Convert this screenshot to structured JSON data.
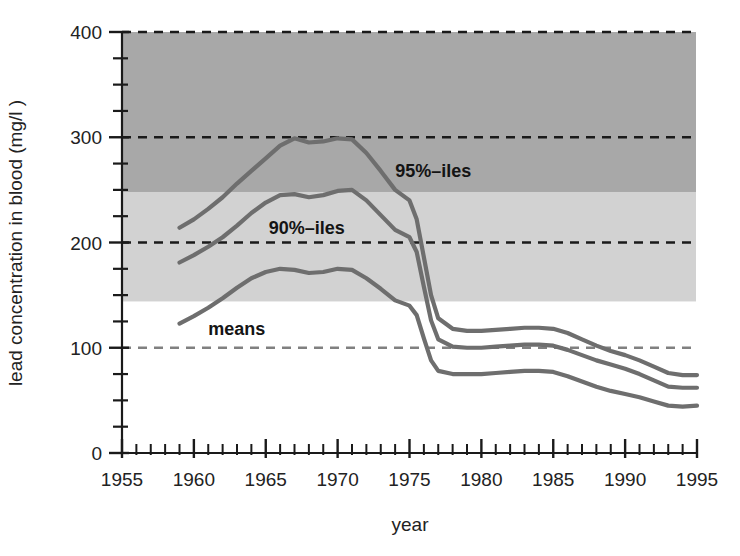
{
  "chart_data": {
    "type": "line",
    "title": "",
    "xlabel": "year",
    "ylabel": "lead concentration in blood (mg/l )",
    "xlim": [
      1955,
      1995
    ],
    "ylim": [
      0,
      400
    ],
    "grid": "dashed horizontal gridlines at 100, 200, 300, 400",
    "legend_position": "inline annotations on curves",
    "x_ticks_major": [
      1955,
      1960,
      1965,
      1970,
      1975,
      1980,
      1985,
      1990,
      1995
    ],
    "x_tick_labels": [
      "1955",
      "1960",
      "1965",
      "1970",
      "1975",
      "1980",
      "1985",
      "1990",
      "1995"
    ],
    "x_tick_minor_step": 1,
    "y_ticks_major": [
      0,
      100,
      200,
      300,
      400
    ],
    "y_tick_labels": [
      "0",
      "100",
      "200",
      "300",
      "400"
    ],
    "y_tick_minor_step": 25,
    "bands": [
      {
        "name": "dark-band",
        "from": 248,
        "to": 400,
        "color": "#a8a8a8"
      },
      {
        "name": "light-band",
        "from": 144,
        "to": 248,
        "color": "#d2d2d2"
      }
    ],
    "gridlines": [
      {
        "value": 400,
        "color": "#1a1a1a"
      },
      {
        "value": 300,
        "color": "#1a1a1a"
      },
      {
        "value": 200,
        "color": "#1a1a1a"
      },
      {
        "value": 100,
        "color": "#808080"
      }
    ],
    "line_color": "#6e6e6e",
    "series": [
      {
        "name": "95%-iles",
        "label": "95%–iles",
        "label_x": 1974.0,
        "label_y": 268,
        "x": [
          1959,
          1960,
          1961,
          1962,
          1963,
          1964,
          1965,
          1966,
          1967,
          1968,
          1969,
          1970,
          1971,
          1972,
          1973,
          1974,
          1975,
          1975.5,
          1976,
          1976.5,
          1977,
          1978,
          1979,
          1980,
          1981,
          1982,
          1983,
          1984,
          1985,
          1986,
          1987,
          1988,
          1989,
          1990,
          1991,
          1992,
          1993,
          1994,
          1995
        ],
        "y": [
          214,
          222,
          232,
          243,
          256,
          268,
          280,
          292,
          299,
          295,
          296,
          299,
          298,
          285,
          268,
          250,
          240,
          222,
          186,
          150,
          128,
          118,
          116,
          116,
          117,
          118,
          119,
          119,
          118,
          114,
          108,
          102,
          97,
          93,
          88,
          82,
          76,
          74,
          74
        ]
      },
      {
        "name": "90%-iles",
        "label": "90%–iles",
        "label_x": 1965.2,
        "label_y": 214,
        "x": [
          1959,
          1960,
          1961,
          1962,
          1963,
          1964,
          1965,
          1966,
          1967,
          1968,
          1969,
          1970,
          1971,
          1972,
          1973,
          1974,
          1975,
          1975.5,
          1976,
          1976.5,
          1977,
          1978,
          1979,
          1980,
          1981,
          1982,
          1983,
          1984,
          1985,
          1986,
          1987,
          1988,
          1989,
          1990,
          1991,
          1992,
          1993,
          1994,
          1995
        ],
        "y": [
          181,
          188,
          196,
          205,
          216,
          228,
          238,
          245,
          246,
          243,
          245,
          249,
          250,
          240,
          226,
          212,
          205,
          191,
          158,
          126,
          108,
          101,
          100,
          100,
          101,
          102,
          103,
          103,
          102,
          98,
          93,
          88,
          84,
          80,
          75,
          69,
          63,
          62,
          62
        ]
      },
      {
        "name": "means",
        "label": "means",
        "label_x": 1961.0,
        "label_y": 118,
        "x": [
          1959,
          1960,
          1961,
          1962,
          1963,
          1964,
          1965,
          1966,
          1967,
          1968,
          1969,
          1970,
          1971,
          1972,
          1973,
          1974,
          1975,
          1975.5,
          1976,
          1976.5,
          1977,
          1978,
          1979,
          1980,
          1981,
          1982,
          1983,
          1984,
          1985,
          1986,
          1987,
          1988,
          1989,
          1990,
          1991,
          1992,
          1993,
          1994,
          1995
        ],
        "y": [
          123,
          130,
          138,
          147,
          157,
          166,
          172,
          175,
          174,
          171,
          172,
          175,
          174,
          166,
          156,
          145,
          140,
          131,
          109,
          88,
          78,
          75,
          75,
          75,
          76,
          77,
          78,
          78,
          77,
          73,
          68,
          63,
          59,
          56,
          53,
          49,
          45,
          44,
          45
        ]
      }
    ]
  },
  "axes": {
    "y_title": "lead concentration in blood (mg/l )",
    "x_title": "year"
  }
}
